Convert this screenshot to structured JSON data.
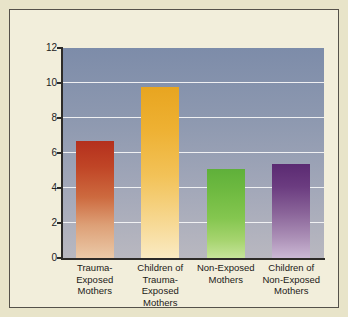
{
  "chart_data": {
    "type": "bar",
    "title": "",
    "subtitle": "",
    "xlabel": "",
    "ylabel": "Mean Extent of GR Methylation",
    "ylabel_parts": {
      "prefix": "Mean Extent of ",
      "italic": "GR",
      "suffix": " Methylation"
    },
    "categories": [
      "Trauma-Exposed Mothers",
      "Children of Trauma-Exposed Mothers",
      "Non-Exposed Mothers",
      "Children of Non-Exposed Mothers"
    ],
    "category_lines": [
      [
        "Trauma-Exposed",
        "Mothers"
      ],
      [
        "Children of",
        "Trauma-",
        "Exposed",
        "Mothers"
      ],
      [
        "Non-Exposed",
        "Mothers"
      ],
      [
        "Children of",
        "Non-Exposed",
        "Mothers"
      ]
    ],
    "values": [
      6.7,
      9.8,
      5.1,
      5.4
    ],
    "bar_colors": [
      "#b4301d",
      "#e8a520",
      "#5fb03a",
      "#5b2a72"
    ],
    "ylim": [
      0,
      12
    ],
    "yticks": [
      0,
      2,
      4,
      6,
      8,
      10,
      12
    ],
    "ytick_labels": [
      "0",
      "2",
      "4",
      "6",
      "8",
      "10",
      "12"
    ],
    "grid": true,
    "gridlines_at": [
      2,
      4,
      6,
      8,
      10
    ],
    "legend": "none",
    "legend_position": "none"
  },
  "figure": {
    "background_color": "#e8e4c9",
    "panel_color": "#f2eedb",
    "panel_border_color": "#55514a",
    "plot_background_top": "#7d8ca9",
    "plot_background_bottom": "#b9b8c0",
    "gridline_color": "#f4f4f6",
    "axis_color": "#2d2b28"
  }
}
